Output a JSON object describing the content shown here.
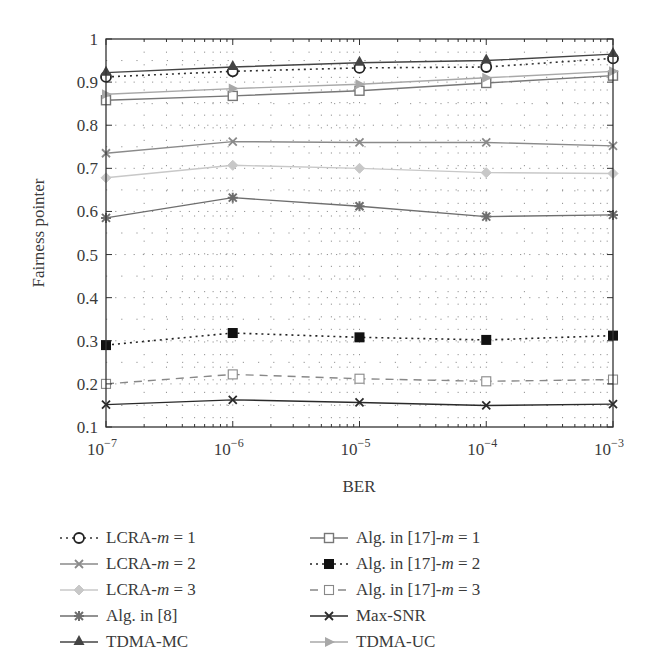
{
  "chart_data": {
    "type": "line",
    "title": "",
    "xlabel": "BER",
    "ylabel": "Fairness pointer",
    "xscale": "log",
    "x": [
      1e-07,
      1e-06,
      1e-05,
      0.0001,
      0.001
    ],
    "x_tick_labels": [
      {
        "base": "10",
        "exp": "−7"
      },
      {
        "base": "10",
        "exp": "−6"
      },
      {
        "base": "10",
        "exp": "−5"
      },
      {
        "base": "10",
        "exp": "−4"
      },
      {
        "base": "10",
        "exp": "−3"
      }
    ],
    "y_ticks": [
      "0.1",
      "0.2",
      "0.3",
      "0.4",
      "0.5",
      "0.6",
      "0.7",
      "0.8",
      "0.9",
      "1"
    ],
    "ylim": [
      0.1,
      1.0
    ],
    "grid": "dotted major and minor",
    "legend_position": "below plot, two columns",
    "series": [
      {
        "name": "LCRA-m = 1",
        "label_prefix": "LCRA-",
        "label_var": "m",
        "label_suffix": " = 1",
        "values": [
          0.912,
          0.925,
          0.933,
          0.935,
          0.955
        ],
        "color": "#333333",
        "dash": "2,4",
        "marker": "circle-open"
      },
      {
        "name": "LCRA-m = 2",
        "label_prefix": "LCRA-",
        "label_var": "m",
        "label_suffix": " = 2",
        "values": [
          0.735,
          0.762,
          0.76,
          0.76,
          0.752
        ],
        "color": "#8a8a8a",
        "dash": "",
        "marker": "x"
      },
      {
        "name": "LCRA-m = 3",
        "label_prefix": "LCRA-",
        "label_var": "m",
        "label_suffix": " = 3",
        "values": [
          0.678,
          0.707,
          0.7,
          0.69,
          0.688
        ],
        "color": "#c8c8c8",
        "dash": "",
        "marker": "diamond"
      },
      {
        "name": "Alg. in [8]",
        "label_prefix": "Alg. in [8]",
        "label_var": "",
        "label_suffix": "",
        "values": [
          0.585,
          0.632,
          0.612,
          0.588,
          0.592
        ],
        "color": "#6e6e6e",
        "dash": "",
        "marker": "star"
      },
      {
        "name": "TDMA-MC",
        "label_prefix": "TDMA-MC",
        "label_var": "",
        "label_suffix": "",
        "values": [
          0.922,
          0.935,
          0.945,
          0.95,
          0.965
        ],
        "color": "#444444",
        "dash": "",
        "marker": "triangle-up"
      },
      {
        "name": "Alg. in [17]-m = 1",
        "label_prefix": "Alg. in [17]-",
        "label_var": "m",
        "label_suffix": " = 1",
        "values": [
          0.858,
          0.868,
          0.88,
          0.898,
          0.915
        ],
        "color": "#777777",
        "dash": "",
        "marker": "square-gray"
      },
      {
        "name": "Alg. in [17]-m = 2",
        "label_prefix": "Alg. in [17]-",
        "label_var": "m",
        "label_suffix": " = 2",
        "values": [
          0.29,
          0.318,
          0.308,
          0.302,
          0.312
        ],
        "color": "#222222",
        "dash": "2,4",
        "marker": "square-filled"
      },
      {
        "name": "Alg. in [17]-m = 3",
        "label_prefix": "Alg. in [17]-",
        "label_var": "m",
        "label_suffix": " = 3",
        "values": [
          0.2,
          0.222,
          0.212,
          0.206,
          0.21
        ],
        "color": "#888888",
        "dash": "8,6",
        "marker": "square-open"
      },
      {
        "name": "Max-SNR",
        "label_prefix": "Max-SNR",
        "label_var": "",
        "label_suffix": "",
        "values": [
          0.152,
          0.163,
          0.157,
          0.15,
          0.153
        ],
        "color": "#2a2a2a",
        "dash": "",
        "marker": "x"
      },
      {
        "name": "TDMA-UC",
        "label_prefix": "TDMA-UC",
        "label_var": "",
        "label_suffix": "",
        "values": [
          0.872,
          0.885,
          0.895,
          0.91,
          0.925
        ],
        "color": "#a8a8a8",
        "dash": "",
        "marker": "triangle-right"
      }
    ]
  },
  "legend": {
    "left_column": [
      0,
      1,
      2,
      3,
      4
    ],
    "right_column": [
      5,
      6,
      7,
      8,
      9
    ]
  }
}
